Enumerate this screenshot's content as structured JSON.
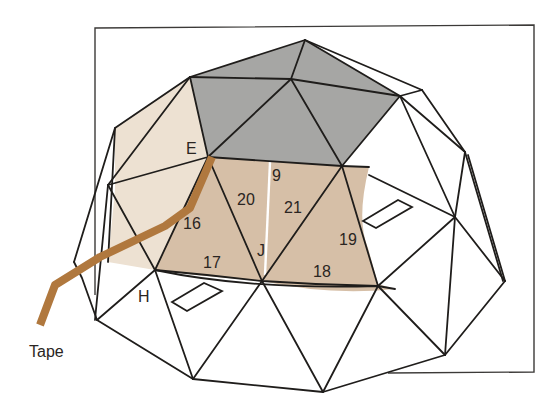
{
  "diagram": {
    "title": "",
    "labels": {
      "E": "E",
      "H": "H",
      "J": "J",
      "n9": "9",
      "n16": "16",
      "n17": "17",
      "n18": "18",
      "n19": "19",
      "n20": "20",
      "n21": "21",
      "tape": "Tape"
    },
    "colors": {
      "gray_panel": "#a6a6a4",
      "light_panel": "#ede1d2",
      "tan_panel": "#d6bfa7",
      "tape": "#b0783e",
      "line": "#1f1d1b",
      "background": "#ffffff",
      "seam": "#ffffff"
    }
  }
}
